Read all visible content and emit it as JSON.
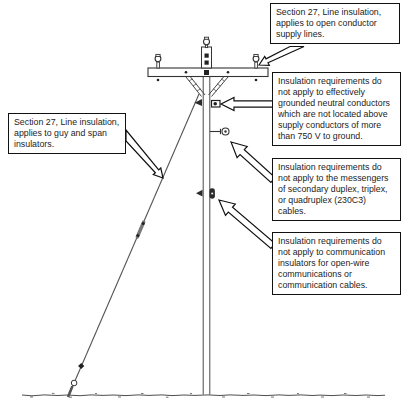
{
  "figure": {
    "colors": {
      "line": "#000000",
      "background": "#ffffff",
      "fixture_dark": "#2b2b2b"
    },
    "callouts": {
      "open_conductor": {
        "lines": [
          "Section 27, Line insulation,",
          "applies to open conductor",
          "supply lines."
        ]
      },
      "guy_span": {
        "lines": [
          "Section 27, Line insulation,",
          "applies to guy and span",
          "insulators."
        ]
      },
      "neutral": {
        "lines": [
          "Insulation requirements do",
          "not apply to effectively",
          "grounded neutral conductors",
          "which are not located above",
          "supply conductors of more",
          "than 750 V to ground."
        ]
      },
      "messengers": {
        "lines": [
          "Insulation requirements do",
          "not apply to the messengers",
          "of secondary duplex, triplex,",
          "or quadruplex (230C3)",
          "cables."
        ]
      },
      "communication": {
        "lines": [
          "Insulation requirements do",
          "not apply to communication",
          "insulators for open-wire",
          "communications or",
          "communication cables."
        ]
      }
    },
    "hardware": [
      "pole-top-pin-insulator",
      "crossarm-pin-insulator-left",
      "crossarm-pin-insulator-right",
      "neutral-spool",
      "secondary-messenger-spool",
      "communication-bracket",
      "guy-strain-insulator",
      "anchor-rod"
    ]
  }
}
